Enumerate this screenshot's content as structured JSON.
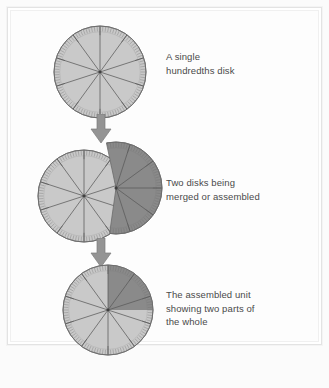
{
  "figure": {
    "title_visible": false,
    "background_color": "#fdfdfd",
    "frame_color": "#e3e3e3",
    "text_color": "#4a4a4a",
    "colors": {
      "disk_light": "#c9c9c9",
      "disk_dark": "#8a8a8a",
      "disk_outline": "#6b6b6b",
      "spoke": "#5a5a5a",
      "tick": "#6f6f6f",
      "arrow": "#949494",
      "arrow_outline": "#7d7d7d"
    },
    "disk_spec": {
      "sectors": 10,
      "ticks": 100,
      "tick_label": "hundredths"
    }
  },
  "steps": [
    {
      "id": "step-single-disk",
      "caption": "A single\nhundredths disk",
      "disk": {
        "kind": "single",
        "sectors": 10,
        "shaded_sectors": 0,
        "fill": "#c9c9c9"
      }
    },
    {
      "id": "step-merging-disks",
      "caption": "Two disks being\nmerged or assembled",
      "disk": {
        "kind": "overlapping-pair",
        "sectors": 10,
        "back_disk_fill": "#c9c9c9",
        "front_disk_fill": "#8a8a8a",
        "front_disk_rotation_deg": -18
      }
    },
    {
      "id": "step-assembled-unit",
      "caption": "The assembled unit\nshowing two parts of\nthe whole",
      "disk": {
        "kind": "single",
        "sectors": 10,
        "shaded_sectors": 2.5,
        "shaded_from_deg": 0,
        "shaded_to_deg": 90,
        "fill": "#c9c9c9",
        "shaded_fill": "#8a8a8a"
      }
    }
  ],
  "arrows": [
    {
      "id": "arrow-1",
      "direction": "down"
    },
    {
      "id": "arrow-2",
      "direction": "down"
    }
  ]
}
